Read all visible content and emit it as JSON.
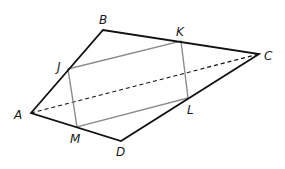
{
  "diagram": {
    "type": "quadrilateral-with-inscribed-parallelogram",
    "colors": {
      "outer_edge": "#111111",
      "inner_edge": "#8a8a8a",
      "diagonal": "#111111",
      "label": "#1a1a1a",
      "background": "#ffffff"
    },
    "vertices": {
      "A": {
        "label": "A",
        "x": 31,
        "y": 113
      },
      "B": {
        "label": "B",
        "x": 103,
        "y": 30
      },
      "C": {
        "label": "C",
        "x": 259,
        "y": 54
      },
      "D": {
        "label": "D",
        "x": 121,
        "y": 141
      }
    },
    "midpoints": {
      "J": {
        "label": "J",
        "x": 68,
        "y": 69
      },
      "K": {
        "label": "K",
        "x": 181,
        "y": 41
      },
      "L": {
        "label": "L",
        "x": 188,
        "y": 98
      },
      "M": {
        "label": "M",
        "x": 77,
        "y": 127
      }
    },
    "outer_quadrilateral": [
      "A",
      "B",
      "C",
      "D"
    ],
    "inner_parallelogram": [
      "J",
      "K",
      "L",
      "M"
    ],
    "diagonal": [
      "A",
      "C"
    ],
    "labels": {
      "A": {
        "text": "A",
        "x": 14,
        "y": 119
      },
      "B": {
        "text": "B",
        "x": 99,
        "y": 24
      },
      "C": {
        "text": "C",
        "x": 264,
        "y": 60
      },
      "D": {
        "text": "D",
        "x": 116,
        "y": 156
      },
      "J": {
        "text": "J",
        "x": 57,
        "y": 71
      },
      "K": {
        "text": "K",
        "x": 176,
        "y": 36
      },
      "L": {
        "text": "L",
        "x": 187,
        "y": 114
      },
      "M": {
        "text": "M",
        "x": 70,
        "y": 143
      }
    }
  }
}
